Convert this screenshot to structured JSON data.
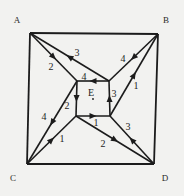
{
  "diagram": {
    "title": "",
    "type": "directed graph",
    "colors": {
      "background": "#f2f2f0",
      "ink": "#1c1c1c"
    },
    "nodes": [
      {
        "id": "A",
        "label": "A",
        "x": 30,
        "y": 33,
        "lx": 17,
        "ly": 23
      },
      {
        "id": "B",
        "label": "B",
        "x": 158,
        "y": 34,
        "lx": 166,
        "ly": 23
      },
      {
        "id": "C",
        "label": "C",
        "x": 27,
        "y": 164,
        "lx": 13,
        "ly": 181
      },
      {
        "id": "D",
        "label": "D",
        "x": 154,
        "y": 164,
        "lx": 165,
        "ly": 181
      },
      {
        "id": "P1",
        "label": "",
        "x": 77,
        "y": 81
      },
      {
        "id": "P2",
        "label": "",
        "x": 109,
        "y": 81
      },
      {
        "id": "P3",
        "label": "",
        "x": 110,
        "y": 116
      },
      {
        "id": "P4",
        "label": "",
        "x": 76,
        "y": 116
      }
    ],
    "center_label": {
      "text": "E",
      "x": 91,
      "y": 96
    },
    "frame_edges": [
      [
        "A",
        "B"
      ],
      [
        "B",
        "D"
      ],
      [
        "D",
        "C"
      ],
      [
        "C",
        "A"
      ]
    ],
    "edges": [
      {
        "from": "A",
        "to": "P1",
        "label": "2",
        "lx": 51,
        "ly": 70
      },
      {
        "from": "P2",
        "to": "A",
        "label": "3",
        "lx": 77,
        "ly": 56
      },
      {
        "from": "P2",
        "to": "P1",
        "label": "4",
        "lx": 84,
        "ly": 80
      },
      {
        "from": "B",
        "to": "P2",
        "label": "4",
        "lx": 123,
        "ly": 62
      },
      {
        "from": "P3",
        "to": "B",
        "label": "1",
        "lx": 136,
        "ly": 89
      },
      {
        "from": "P3",
        "to": "P2",
        "label": "3",
        "lx": 114,
        "ly": 97
      },
      {
        "from": "P1",
        "to": "P4",
        "label": "2",
        "lx": 67,
        "ly": 109
      },
      {
        "from": "P4",
        "to": "P3",
        "label": "1",
        "lx": 96,
        "ly": 126
      },
      {
        "from": "P1",
        "to": "C",
        "label": "4",
        "lx": 44,
        "ly": 120
      },
      {
        "from": "C",
        "to": "P4",
        "label": "1",
        "lx": 62,
        "ly": 142
      },
      {
        "from": "P4",
        "to": "D",
        "label": "2",
        "lx": 103,
        "ly": 147
      },
      {
        "from": "D",
        "to": "P3",
        "label": "3",
        "lx": 128,
        "ly": 130
      }
    ]
  }
}
